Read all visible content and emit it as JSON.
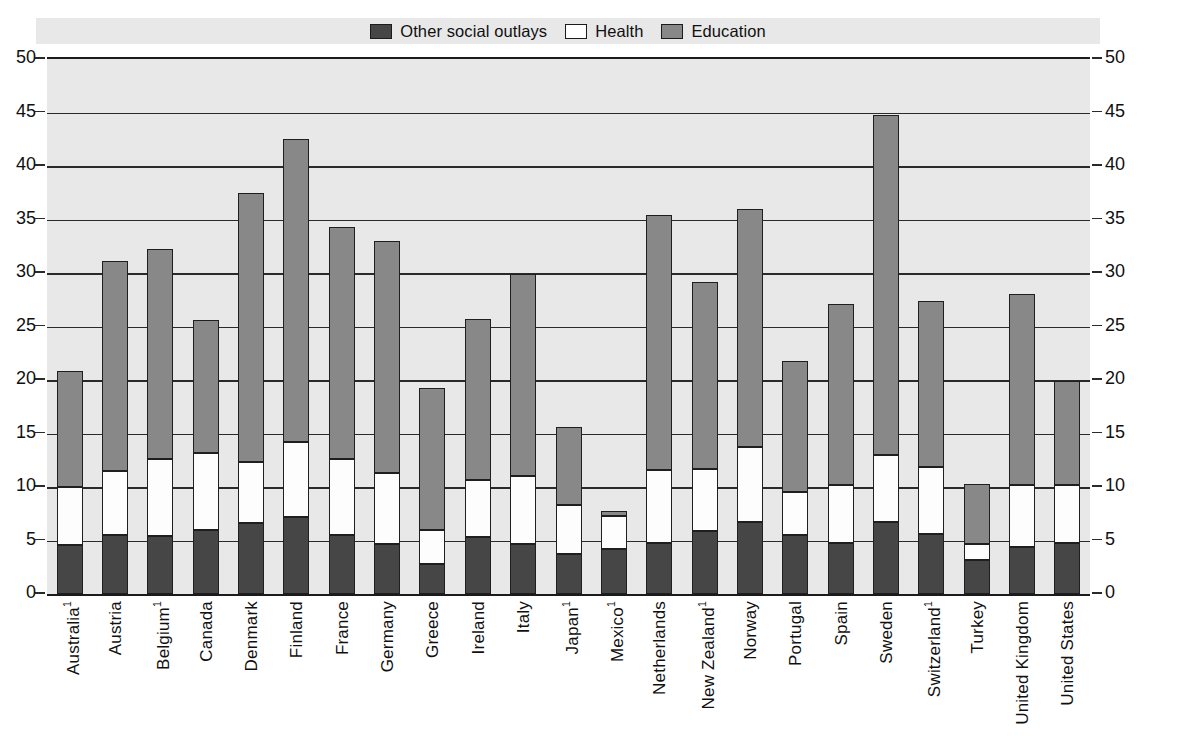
{
  "legend": {
    "items": [
      {
        "label": "Other social outlays",
        "color": "#464646",
        "key": "other"
      },
      {
        "label": "Health",
        "color": "#ffffff",
        "key": "health"
      },
      {
        "label": "Education",
        "color": "#888888",
        "key": "education"
      }
    ]
  },
  "axis": {
    "ticks": [
      "0",
      "5",
      "10",
      "15",
      "20",
      "25",
      "30",
      "35",
      "40",
      "45",
      "50"
    ]
  },
  "chart_data": {
    "type": "bar",
    "stacked": true,
    "title": "",
    "subtitle": "",
    "xlabel": "",
    "ylabel": "",
    "ylim": [
      0,
      50
    ],
    "ytick_step": 5,
    "grid": true,
    "legend_position": "top",
    "categories": [
      "Australia",
      "Austria",
      "Belgium",
      "Canada",
      "Denmark",
      "Finland",
      "France",
      "Germany",
      "Greece",
      "Ireland",
      "Italy",
      "Japan",
      "Mexico",
      "Netherlands",
      "New Zealand",
      "Norway",
      "Portugal",
      "Spain",
      "Sweden",
      "Switzerland",
      "Turkey",
      "United Kingdom",
      "United States"
    ],
    "category_footnotes": {
      "Australia": "1",
      "Belgium": "1",
      "Japan": "1",
      "Mexico": "1",
      "New Zealand": "1",
      "Switzerland": "1"
    },
    "series": [
      {
        "name": "Other social outlays",
        "color": "#464646",
        "values": [
          4.6,
          5.5,
          5.4,
          6.0,
          6.6,
          7.2,
          5.5,
          4.7,
          2.8,
          5.3,
          4.7,
          3.7,
          4.2,
          4.8,
          5.9,
          6.7,
          5.5,
          4.8,
          6.7,
          5.6,
          3.2,
          4.4,
          4.8
        ]
      },
      {
        "name": "Health",
        "color": "#ffffff",
        "values": [
          5.4,
          6.0,
          7.2,
          7.2,
          5.7,
          7.0,
          7.1,
          6.6,
          3.2,
          5.4,
          6.3,
          4.6,
          3.1,
          6.8,
          5.8,
          7.0,
          4.0,
          5.4,
          6.3,
          6.3,
          1.5,
          5.8,
          5.4
        ]
      },
      {
        "name": "Education",
        "color": "#888888",
        "values": [
          10.8,
          19.6,
          19.6,
          12.4,
          25.2,
          28.3,
          21.7,
          21.7,
          13.3,
          15.0,
          18.9,
          7.3,
          0.5,
          23.8,
          17.5,
          22.3,
          12.3,
          16.9,
          31.8,
          15.5,
          5.6,
          17.8,
          9.7
        ]
      }
    ],
    "totals": [
      20.8,
      31.1,
      32.2,
      25.6,
      37.5,
      42.5,
      34.3,
      33.0,
      19.3,
      25.7,
      29.9,
      15.6,
      7.8,
      35.4,
      29.2,
      36.0,
      21.8,
      27.1,
      44.8,
      27.4,
      10.3,
      28.0,
      19.9
    ]
  }
}
